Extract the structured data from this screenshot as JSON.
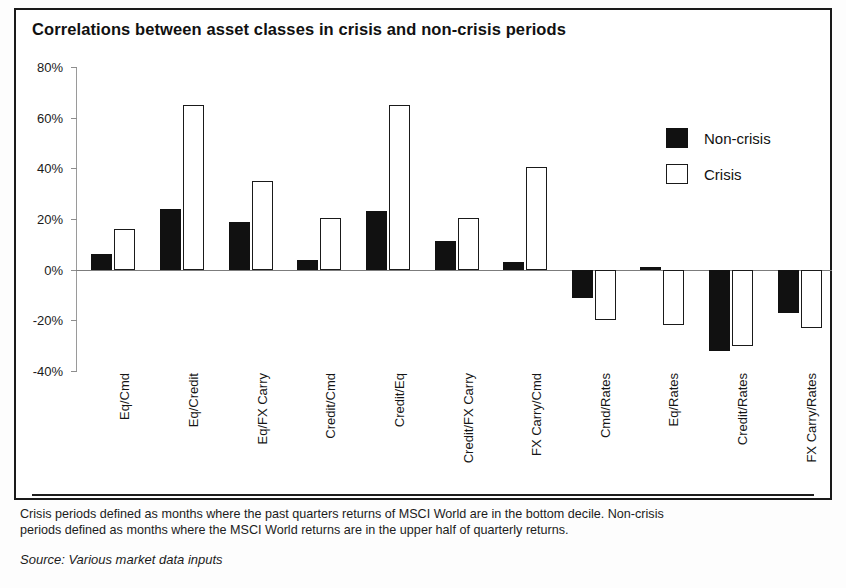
{
  "exhibit": {
    "title": "Correlations between asset classes in crisis and non-crisis periods",
    "note_line_1": "Crisis periods defined as months where the past quarters returns of MSCI World are in the bottom decile. Non-crisis",
    "note_line_2": "periods defined as months where the MSCI World returns are in the upper half of quarterly returns.",
    "source": "Source: Various market data inputs"
  },
  "legend": {
    "position": "top-right",
    "items": [
      {
        "label": "Non-crisis",
        "swatch": "filled-black-square",
        "color": "#111111"
      },
      {
        "label": "Crisis",
        "swatch": "outlined-white-square",
        "color": "#ffffff"
      }
    ]
  },
  "chart_data": {
    "type": "bar",
    "title": "Correlations between asset classes in crisis and non-crisis periods",
    "xlabel": "",
    "ylabel": "",
    "ylim": [
      -40,
      80
    ],
    "ytick_labels": [
      "80%",
      "60%",
      "40%",
      "20%",
      "0%",
      "-20%",
      "-40%"
    ],
    "ytick_values": [
      80,
      60,
      40,
      20,
      0,
      -20,
      -40
    ],
    "grid": false,
    "categories": [
      "Eq/Cmd",
      "Eq/Credit",
      "Eq/FX Carry",
      "Credit/Cmd",
      "Credit/Eq",
      "Credit/FX Carry",
      "FX Carry/Cmd",
      "Cmd/Rates",
      "Eq/Rates",
      "Credit/Rates",
      "FX Carry/Rates"
    ],
    "series": [
      {
        "name": "Non-crisis",
        "color": "#111111",
        "values": [
          6,
          24,
          19,
          4,
          23,
          11.5,
          3,
          -11,
          1,
          -32,
          -17
        ]
      },
      {
        "name": "Crisis",
        "color": "#ffffff",
        "values": [
          16,
          65,
          35,
          20.5,
          65,
          20.5,
          40.5,
          -20,
          -22,
          -30,
          -23
        ]
      }
    ]
  }
}
